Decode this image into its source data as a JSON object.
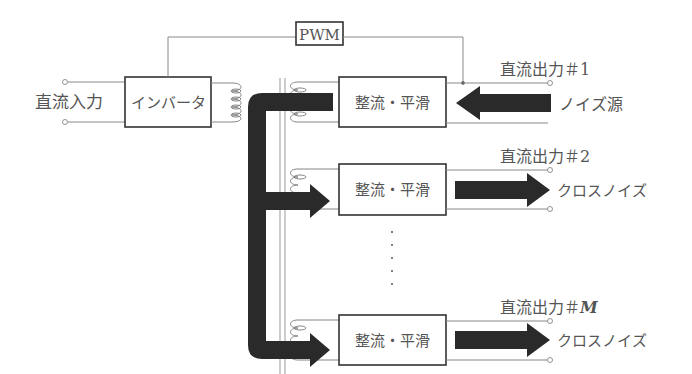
{
  "diagram": {
    "type": "block-diagram",
    "input_label": "直流入力",
    "inverter_label": "インバータ",
    "pwm_label": "PWM",
    "rectifier_label": "整流・平滑",
    "outputs": [
      {
        "label": "直流出力＃1",
        "noise_label": "ノイズ源",
        "noise_direction": "in"
      },
      {
        "label": "直流出力＃2",
        "noise_label": "クロスノイズ",
        "noise_direction": "out"
      },
      {
        "label": "直流出力＃",
        "label_suffix": "M",
        "noise_label": "クロスノイズ",
        "noise_direction": "out"
      }
    ],
    "ellipsis": "・・・・・",
    "colors": {
      "arrow": "#2a2a2a",
      "box_border": "#333333",
      "wire": "#888888",
      "text": "#555555"
    }
  }
}
